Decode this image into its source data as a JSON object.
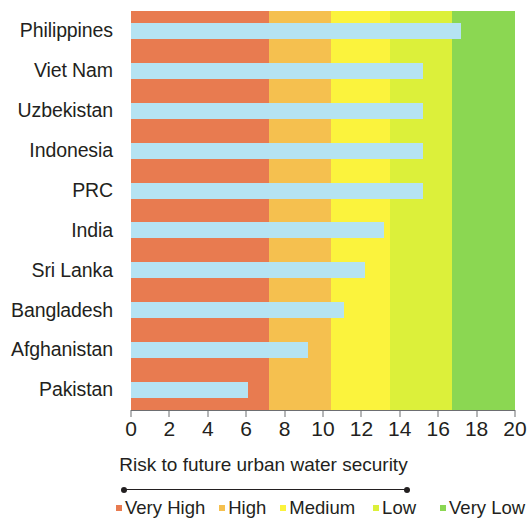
{
  "chart_data": {
    "type": "bar",
    "orientation": "horizontal",
    "title": "",
    "caption": "Risk to future urban water security",
    "xlabel": "",
    "ylabel": "",
    "xlim": [
      0,
      20
    ],
    "grid": false,
    "xticks": [
      0,
      2,
      4,
      6,
      8,
      10,
      12,
      14,
      16,
      18,
      20
    ],
    "xtick_labels": [
      "0",
      "2",
      "4",
      "6",
      "8",
      "10",
      "12",
      "14",
      "16",
      "18",
      "20"
    ],
    "categories": [
      "Philippines",
      "Viet Nam",
      "Uzbekistan",
      "Indonesia",
      "PRC",
      "India",
      "Sri Lanka",
      "Bangladesh",
      "Afghanistan",
      "Pakistan"
    ],
    "values": [
      17.2,
      15.2,
      15.2,
      15.2,
      15.2,
      13.2,
      12.2,
      11.1,
      9.2,
      6.1
    ],
    "bar_color": "#b5e3f2",
    "series": [
      {
        "name": "Risk to future urban water security",
        "values": [
          17.2,
          15.2,
          15.2,
          15.2,
          15.2,
          13.2,
          12.2,
          11.1,
          9.2,
          6.1
        ]
      }
    ],
    "background_bands": [
      {
        "label": "Very High",
        "from": 0.0,
        "to": 7.2,
        "color": "#e87b50"
      },
      {
        "label": "High",
        "from": 7.2,
        "to": 10.4,
        "color": "#f5c04f"
      },
      {
        "label": "Medium",
        "from": 10.4,
        "to": 13.5,
        "color": "#fbf33d"
      },
      {
        "label": "Low",
        "from": 13.5,
        "to": 16.7,
        "color": "#dcf03a"
      },
      {
        "label": "Very Low",
        "from": 16.7,
        "to": 20.0,
        "color": "#8bd752"
      }
    ],
    "legend": {
      "position": "bottom",
      "entries": [
        {
          "label": "Very High",
          "color": "#e87b50"
        },
        {
          "label": "High",
          "color": "#f5c04f"
        },
        {
          "label": "Medium",
          "color": "#fbf33d"
        },
        {
          "label": "Low",
          "color": "#dcf03a"
        },
        {
          "label": "Very Low",
          "color": "#8bd752"
        }
      ]
    }
  }
}
